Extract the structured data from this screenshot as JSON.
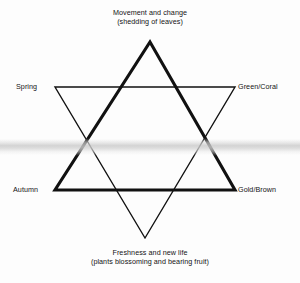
{
  "diagram": {
    "type": "hexagram-seasons-diagram",
    "background_color": "#fdfdfd",
    "line_color": "#111111",
    "scan_band_color": "#c8c8c8",
    "labels": {
      "top": {
        "line1": "Movement and change",
        "line2": "(shedding of leaves)"
      },
      "bottom": {
        "line1": "Freshness and new life",
        "line2": "(plants blossoming and bearing fruit)"
      },
      "left_upper": "Spring",
      "right_upper": "Green/Coral",
      "left_lower": "Autumn",
      "right_lower": "Gold/Brown"
    },
    "shapes": {
      "upward_triangle": {
        "name": "upward-triangle",
        "stroke_width": 3.1,
        "points": "150,42 235,190 55,190"
      },
      "downward_triangle": {
        "name": "downward-triangle",
        "stroke_width": 1.4,
        "points": "55,87 235,87 145,238"
      }
    }
  }
}
